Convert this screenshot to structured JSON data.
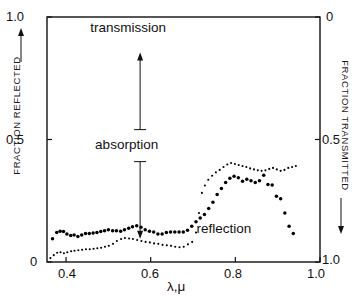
{
  "chart_data": {
    "type": "scatter",
    "title": "",
    "xlabel": "λ,μ",
    "ylabel_left": "FRACTION REFLECTED",
    "ylabel_right": "FRACTION TRANSMITTED",
    "xlim": [
      0.355,
      1.0
    ],
    "ylim_left": [
      0.0,
      1.0
    ],
    "ylim_right": [
      1.0,
      0.0
    ],
    "grid": false,
    "legend_position": "inline-annotations",
    "xticks": [
      0.4,
      0.6,
      0.8,
      1.0
    ],
    "xtick_labels": [
      "0.4",
      "0.6",
      "0.8",
      "1.0"
    ],
    "yticks_left": [
      0.0,
      0.5,
      1.0
    ],
    "ytick_labels_left": [
      "0",
      "0.5",
      "1.0"
    ],
    "yticks_right": [
      0.0,
      0.5,
      1.0
    ],
    "ytick_labels_right": [
      "0",
      "0.5",
      "1.0"
    ],
    "annotations": [
      {
        "name": "absorption",
        "text": "absorption",
        "x": 0.575,
        "y_top": 0.855,
        "y_bottom": 0.095,
        "style": "double-arrow"
      }
    ],
    "series": [
      {
        "name": "transmission",
        "label": "transmission",
        "axis": "right",
        "marker": "filled-circle",
        "label_x": 0.58,
        "label_y": 0.955,
        "x": [
          0.368,
          0.378,
          0.386,
          0.394,
          0.402,
          0.411,
          0.419,
          0.428,
          0.437,
          0.446,
          0.455,
          0.464,
          0.473,
          0.482,
          0.491,
          0.5,
          0.51,
          0.519,
          0.529,
          0.538,
          0.548,
          0.557,
          0.567,
          0.577,
          0.587,
          0.597,
          0.607,
          0.617,
          0.627,
          0.637,
          0.647,
          0.657,
          0.667,
          0.677,
          0.687,
          0.697,
          0.707,
          0.717,
          0.727,
          0.737,
          0.747,
          0.757,
          0.767,
          0.777,
          0.787,
          0.797,
          0.807,
          0.817,
          0.827,
          0.837,
          0.847,
          0.857,
          0.867,
          0.877,
          0.887,
          0.897,
          0.907,
          0.917,
          0.927,
          0.937
        ],
        "y": [
          0.905,
          0.88,
          0.874,
          0.876,
          0.886,
          0.892,
          0.89,
          0.896,
          0.89,
          0.884,
          0.884,
          0.882,
          0.88,
          0.876,
          0.872,
          0.868,
          0.872,
          0.872,
          0.874,
          0.868,
          0.862,
          0.856,
          0.852,
          0.858,
          0.868,
          0.874,
          0.878,
          0.886,
          0.886,
          0.88,
          0.878,
          0.878,
          0.878,
          0.878,
          0.87,
          0.854,
          0.836,
          0.82,
          0.806,
          0.782,
          0.756,
          0.724,
          0.7,
          0.676,
          0.658,
          0.65,
          0.656,
          0.67,
          0.662,
          0.668,
          0.676,
          0.668,
          0.646,
          0.684,
          0.686,
          0.732,
          0.742,
          0.8,
          0.854,
          0.884
        ]
      },
      {
        "name": "reflection",
        "label": "reflection",
        "axis": "left",
        "marker": "small-dot",
        "label_x": 0.765,
        "label_y": 0.135,
        "x": [
          0.363,
          0.371,
          0.379,
          0.387,
          0.395,
          0.403,
          0.412,
          0.42,
          0.429,
          0.438,
          0.447,
          0.456,
          0.465,
          0.474,
          0.483,
          0.492,
          0.501,
          0.511,
          0.52,
          0.53,
          0.539,
          0.549,
          0.558,
          0.568,
          0.578,
          0.588,
          0.598,
          0.608,
          0.618,
          0.628,
          0.638,
          0.648,
          0.658,
          0.668,
          0.678,
          0.688,
          0.698,
          0.707,
          0.714,
          0.721,
          0.728,
          0.736,
          0.745,
          0.754,
          0.763,
          0.772,
          0.781,
          0.79,
          0.799,
          0.808,
          0.817,
          0.826,
          0.835,
          0.844,
          0.853,
          0.862,
          0.871,
          0.88,
          0.889,
          0.898,
          0.907,
          0.916,
          0.925,
          0.934,
          0.943
        ],
        "y": [
          0.016,
          0.028,
          0.038,
          0.04,
          0.036,
          0.04,
          0.044,
          0.046,
          0.048,
          0.05,
          0.052,
          0.052,
          0.054,
          0.056,
          0.058,
          0.062,
          0.066,
          0.074,
          0.086,
          0.094,
          0.098,
          0.096,
          0.094,
          0.09,
          0.086,
          0.082,
          0.08,
          0.076,
          0.074,
          0.07,
          0.068,
          0.066,
          0.062,
          0.06,
          0.062,
          0.072,
          0.082,
          0.12,
          0.2,
          0.282,
          0.312,
          0.336,
          0.352,
          0.366,
          0.376,
          0.388,
          0.398,
          0.404,
          0.4,
          0.396,
          0.392,
          0.388,
          0.382,
          0.378,
          0.374,
          0.372,
          0.374,
          0.38,
          0.384,
          0.378,
          0.372,
          0.376,
          0.384,
          0.388,
          0.392
        ]
      }
    ]
  },
  "axes": {
    "left_title": "FRACTION REFLECTED",
    "right_title": "FRACTION TRANSMITTED",
    "x_title": "λ,μ",
    "left_ticks": [
      "1.0",
      "0.5",
      "0"
    ],
    "right_ticks": [
      "0",
      "0.5",
      "1.0"
    ],
    "x_ticks": [
      "0.4",
      "0.6",
      "0.8",
      "1.0"
    ],
    "corner_top_right": "0",
    "corner_bottom_right": "1.0"
  },
  "labels": {
    "transmission": "transmission",
    "reflection": "reflection",
    "absorption": "absorption"
  },
  "colors": {
    "ink": "#111111",
    "background": "#ffffff",
    "marker": "#000000"
  }
}
